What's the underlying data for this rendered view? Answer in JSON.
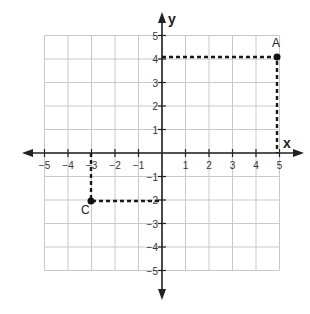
{
  "chart_data": {
    "type": "scatter",
    "title": "",
    "xlabel": "x",
    "ylabel": "y",
    "xlim": [
      -5,
      5
    ],
    "ylim": [
      -5,
      5
    ],
    "grid": true,
    "x_ticks": [
      "-5",
      "-4",
      "-3",
      "-2",
      "-1",
      "1",
      "2",
      "3",
      "4",
      "5"
    ],
    "y_ticks": [
      "5",
      "4",
      "3",
      "2",
      "1",
      "-1",
      "-2",
      "-3",
      "-4",
      "-5"
    ],
    "points": [
      {
        "label": "A",
        "x": 5,
        "y": 4,
        "projections": "dashed lines to both axes"
      },
      {
        "label": "C",
        "x": -3,
        "y": -2,
        "projections": "dashed lines to both axes"
      }
    ]
  },
  "labels": {
    "x_axis": "x",
    "y_axis": "y",
    "point_a": "A",
    "point_c": "C"
  },
  "colors": {
    "grid": "#c9c9c9",
    "axis": "#222222",
    "dashed": "#1a1a1a"
  }
}
